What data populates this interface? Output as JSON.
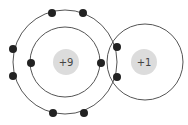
{
  "diagram": {
    "title": "",
    "atoms": [
      {
        "name": "fluorine",
        "nucleus_label": "+9",
        "center": [
          65,
          62
        ],
        "shells": [
          {
            "r": 35,
            "electrons": [
              [
                31,
                63
              ],
              [
                101,
                63
              ]
            ]
          },
          {
            "r": 52,
            "electrons": [
              [
                52,
                13
              ],
              [
                83,
                13
              ],
              [
                13,
                49
              ],
              [
                13,
                76
              ],
              [
                53,
                113
              ],
              [
                84,
                113
              ],
              [
                117,
                47
              ],
              [
                117,
                77
              ]
            ]
          }
        ]
      },
      {
        "name": "hydrogen",
        "nucleus_label": "+1",
        "center": [
          145,
          62
        ],
        "shells": [
          {
            "r": 38,
            "electrons": []
          }
        ]
      }
    ],
    "colors": {
      "nucleus": "#dcdcdc",
      "electron": "#222222",
      "shell": "#555555"
    }
  }
}
